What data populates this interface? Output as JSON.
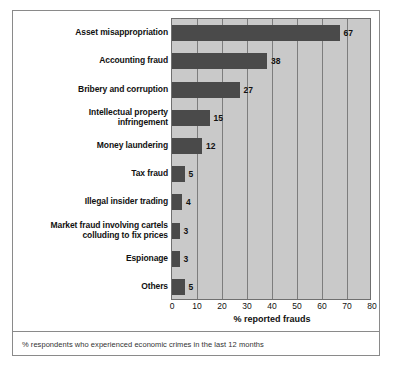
{
  "chart_data": {
    "type": "bar",
    "orientation": "horizontal",
    "title": "",
    "xlabel": "% reported frauds",
    "ylabel": "",
    "xlim": [
      0,
      80
    ],
    "xticks": [
      0,
      10,
      20,
      30,
      40,
      50,
      60,
      70,
      80
    ],
    "grid": true,
    "legend": false,
    "categories": [
      "Asset misappropriation",
      "Accounting fraud",
      "Bribery and corruption",
      "Intellectual property infringement",
      "Money laundering",
      "Tax fraud",
      "Illegal insider trading",
      "Market fraud involving cartels colluding to fix prices",
      "Espionage",
      "Others"
    ],
    "category_lines": [
      [
        "Asset misappropriation"
      ],
      [
        "Accounting fraud"
      ],
      [
        "Bribery and corruption"
      ],
      [
        "Intellectual property",
        "infringement"
      ],
      [
        "Money laundering"
      ],
      [
        "Tax fraud"
      ],
      [
        "Illegal insider trading"
      ],
      [
        "Market fraud involving cartels",
        "colluding to fix prices"
      ],
      [
        "Espionage"
      ],
      [
        "Others"
      ]
    ],
    "values": [
      67,
      38,
      27,
      15,
      12,
      5,
      4,
      3,
      3,
      5
    ],
    "value_labels": [
      "67",
      "38",
      "27",
      "15",
      "12",
      "5",
      "4",
      "3",
      "3",
      "5"
    ],
    "colors": {
      "bar": "#4a4a4a",
      "plot_background": "#c9c9c9",
      "gridline": "#7d7d7d",
      "border": "#8a8a8a",
      "text": "#111111"
    }
  },
  "footnote": "% respondents who experienced economic crimes in the last 12 months"
}
